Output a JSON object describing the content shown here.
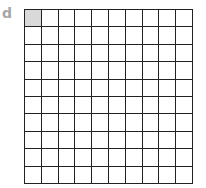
{
  "label": "d",
  "grid": {
    "rows": 10,
    "columns": 10,
    "shaded_cells": [
      [
        0,
        0
      ]
    ],
    "shaded_color": "#d9d9d9",
    "line_color": "#222222"
  }
}
